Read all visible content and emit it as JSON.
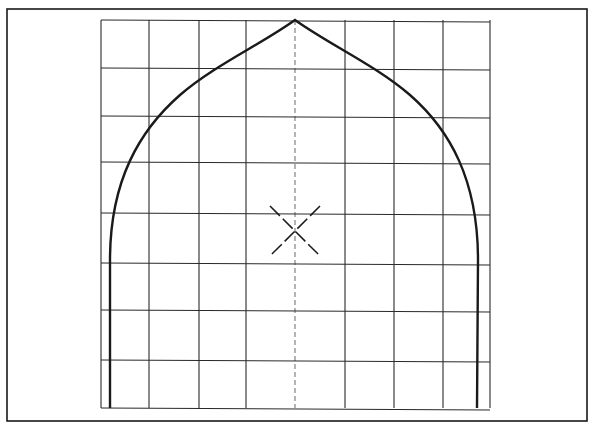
{
  "diagram": {
    "title": "",
    "colors": {
      "ink": "#1a1a1a",
      "paper": "#ffffff",
      "grid": "#2a2a2a"
    },
    "frame": {
      "x": 7,
      "y": 9,
      "width": 580,
      "height": 412
    },
    "grid": {
      "columns_x": [
        101,
        149,
        199,
        246,
        295,
        345,
        394,
        443,
        490
      ],
      "rows_y": [
        20,
        68,
        116,
        162,
        213,
        263,
        310,
        360,
        408
      ]
    },
    "arch": {
      "apex": [
        295,
        20
      ],
      "left_base": [
        110,
        408
      ],
      "right_base": [
        477,
        408
      ]
    },
    "center_mark": {
      "x": 295,
      "y": 230,
      "label": "X"
    }
  }
}
